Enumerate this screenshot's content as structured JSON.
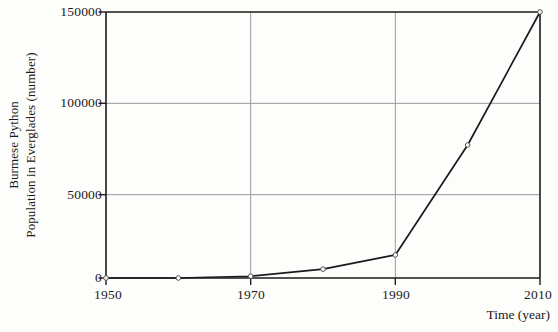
{
  "chart_data": {
    "type": "line",
    "title": "",
    "xlabel": "Time (year)",
    "ylabel_line1": "Burmese Python",
    "ylabel_line2": "Population in Everglades (number)",
    "ylabel": "Burmese Python Population in Everglades (number)",
    "x": [
      1950,
      1960,
      1970,
      1980,
      1990,
      2000,
      2010
    ],
    "values": [
      0,
      0,
      1000,
      5000,
      13000,
      75000,
      150000
    ],
    "series": [
      {
        "name": "Burmese Python Population in Everglades",
        "values": [
          0,
          0,
          1000,
          5000,
          13000,
          75000,
          150000
        ]
      }
    ],
    "xlim": [
      1950,
      2010
    ],
    "ylim": [
      0,
      150000
    ],
    "xticks": [
      1950,
      1970,
      1990,
      2010
    ],
    "xtick_labels": [
      "1950",
      "1970",
      "1990",
      "2010"
    ],
    "yticks": [
      0,
      50000,
      100000,
      150000
    ],
    "ytick_labels": [
      "0",
      "50000",
      "100000",
      "150000"
    ],
    "grid": true,
    "legend": "none",
    "markers": "open-circle",
    "line_color": "#1a1a1a",
    "grid_color": "#9a9a9a",
    "axis_color": "#1a1a1a",
    "background_color": "#fdfdfb"
  }
}
